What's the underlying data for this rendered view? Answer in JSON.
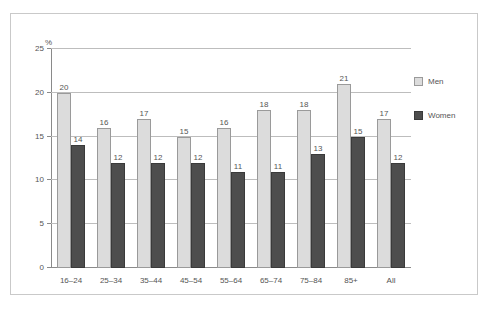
{
  "chart_data": {
    "type": "bar",
    "title": "",
    "subtitle": "",
    "xlabel": "",
    "ylabel": "%",
    "ylim": [
      0,
      25
    ],
    "yticks": [
      0,
      5,
      10,
      15,
      20,
      25
    ],
    "ytick_labels": [
      "0",
      "5",
      "10",
      "15",
      "20",
      "25"
    ],
    "grid": true,
    "legend_position": "right",
    "categories": [
      "16–24",
      "25–34",
      "35–44",
      "45–54",
      "55–64",
      "65–74",
      "75–84",
      "85+",
      "All"
    ],
    "series": [
      {
        "name": "Men",
        "color": "#dcdcdc",
        "values": [
          20,
          16,
          17,
          15,
          16,
          18,
          18,
          21,
          17
        ],
        "labels": [
          "20",
          "16",
          "17",
          "15",
          "16",
          "18",
          "18",
          "21",
          "17"
        ]
      },
      {
        "name": "Women",
        "color": "#4d4d4d",
        "values": [
          14,
          12,
          12,
          12,
          11,
          11,
          13,
          15,
          12
        ],
        "labels": [
          "14",
          "12",
          "12",
          "12",
          "11",
          "11",
          "13",
          "15",
          "12"
        ]
      }
    ]
  },
  "legend": {
    "items": [
      {
        "label": "Men",
        "swatch": "men"
      },
      {
        "label": "Women",
        "swatch": "women"
      }
    ]
  }
}
